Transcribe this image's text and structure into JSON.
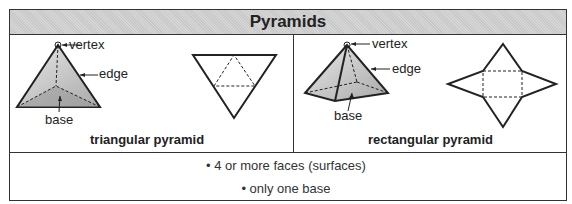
{
  "title": "Pyramids",
  "panels": [
    {
      "caption": "triangular pyramid",
      "labels": {
        "vertex": "vertex",
        "edge": "edge",
        "base": "base"
      }
    },
    {
      "caption": "rectangular pyramid",
      "labels": {
        "vertex": "vertex",
        "edge": "edge",
        "base": "base"
      }
    }
  ],
  "facts": [
    "• 4 or more faces (surfaces)",
    "• only one base"
  ]
}
